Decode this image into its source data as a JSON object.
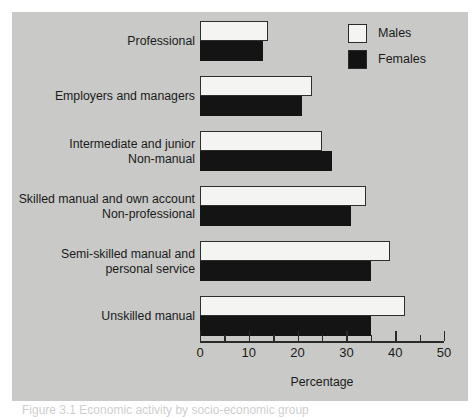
{
  "figure": {
    "background_color": "#c9c9c7",
    "page_color": "#ffffff",
    "caption": "Figure 3.1 Economic activity by socio-economic group"
  },
  "legend": {
    "position": "top-right",
    "entries": [
      {
        "label": "Males",
        "color": "#f4f4f2",
        "swatch": "white-square"
      },
      {
        "label": "Females",
        "color": "#121212",
        "swatch": "black-square"
      }
    ]
  },
  "axis": {
    "xlabel": "Percentage",
    "ticks": [
      {
        "value": 0,
        "label": "0",
        "type": "major"
      },
      {
        "value": 5,
        "label": "",
        "type": "minor"
      },
      {
        "value": 10,
        "label": "10",
        "type": "major"
      },
      {
        "value": 15,
        "label": "",
        "type": "minor"
      },
      {
        "value": 20,
        "label": "20",
        "type": "major"
      },
      {
        "value": 25,
        "label": "",
        "type": "minor"
      },
      {
        "value": 30,
        "label": "30",
        "type": "major"
      },
      {
        "value": 35,
        "label": "",
        "type": "minor"
      },
      {
        "value": 40,
        "label": "40",
        "type": "major"
      },
      {
        "value": 45,
        "label": "",
        "type": "minor"
      },
      {
        "value": 50,
        "label": "50",
        "type": "major"
      }
    ]
  },
  "chart_data": {
    "type": "bar",
    "orientation": "horizontal",
    "title": "",
    "xlabel": "Percentage",
    "ylabel": "",
    "xlim": [
      0,
      50
    ],
    "grid": false,
    "legend_position": "top-right",
    "categories": [
      "Professional",
      "Employers and managers",
      "Intermediate and junior Non-manual",
      "Skilled manual and own account Non-professional",
      "Semi-skilled manual and personal service",
      "Unskilled manual"
    ],
    "category_lines": [
      [
        "Professional"
      ],
      [
        "Employers and managers"
      ],
      [
        "Intermediate and junior",
        "Non-manual"
      ],
      [
        "Skilled manual and own account",
        "Non-professional"
      ],
      [
        "Semi-skilled manual and",
        "personal service"
      ],
      [
        "Unskilled manual"
      ]
    ],
    "series": [
      {
        "name": "Males",
        "color": "#f4f4f2",
        "values": [
          14,
          23,
          25,
          34,
          39,
          42
        ]
      },
      {
        "name": "Females",
        "color": "#141414",
        "values": [
          13,
          21,
          27,
          31,
          35,
          35
        ]
      }
    ]
  }
}
